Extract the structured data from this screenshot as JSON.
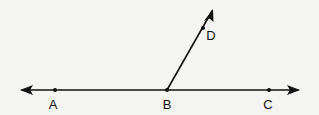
{
  "diagram": {
    "type": "geometry",
    "colors": {
      "ink": "#111111",
      "background": "#f5f5f4"
    },
    "line": {
      "name": "line AC",
      "y": 90,
      "x_start": 20,
      "x_end": 300,
      "arrows": "both"
    },
    "ray": {
      "name": "ray BD",
      "from": [
        167,
        90
      ],
      "to": [
        213,
        9
      ]
    },
    "points": [
      {
        "id": "A",
        "label": "A",
        "x": 55,
        "y": 90,
        "label_x": 53,
        "label_y": 104
      },
      {
        "id": "B",
        "label": "B",
        "x": 167,
        "y": 90,
        "label_x": 167,
        "label_y": 104
      },
      {
        "id": "C",
        "label": "C",
        "x": 269,
        "y": 90,
        "label_x": 268,
        "label_y": 104
      },
      {
        "id": "D",
        "label": "D",
        "x": 203,
        "y": 28,
        "label_x": 211,
        "label_y": 35
      }
    ]
  }
}
